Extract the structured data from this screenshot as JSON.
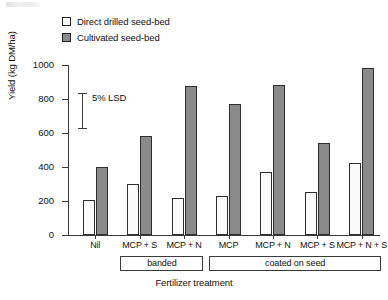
{
  "chart_data": {
    "type": "bar",
    "title": "",
    "xlabel": "Fertilizer treatment",
    "ylabel": "Yield (kg DM/ha)",
    "categories": [
      "Nil",
      "MCP + S",
      "MCP + N",
      "MCP",
      "MCP + N",
      "MCP + S",
      "MCP + N + S"
    ],
    "series": [
      {
        "name": "Direct drilled seed-bed",
        "values": [
          205,
          300,
          215,
          230,
          370,
          255,
          425
        ],
        "color": "#fbfbfb"
      },
      {
        "name": "Cultivated seed-bed",
        "values": [
          400,
          580,
          875,
          770,
          880,
          540,
          980
        ],
        "color": "#8a8a8a"
      }
    ],
    "ylim": [
      0,
      1000
    ],
    "yticks": [
      0,
      200,
      400,
      600,
      800,
      1000
    ],
    "ytick_labels": [
      "0",
      "200",
      "400",
      "600",
      "800",
      "1000"
    ],
    "grid": false,
    "legend_position": "top-left",
    "annotations": [
      {
        "name": "lsd",
        "label": "5% LSD",
        "type": "error-bar",
        "y_top": 835,
        "y_bottom": 630,
        "length": 205
      }
    ],
    "category_groups": [
      {
        "label": "banded",
        "categories": [
          "MCP + S",
          "MCP + N"
        ]
      },
      {
        "label": "coated on seed",
        "categories": [
          "MCP",
          "MCP + N",
          "MCP + S",
          "MCP + N + S"
        ]
      }
    ]
  },
  "legend": {
    "items": [
      {
        "label": "Direct drilled seed-bed",
        "swatch": "open-square"
      },
      {
        "label": "Cultivated seed-bed",
        "swatch": "filled-square"
      }
    ]
  }
}
